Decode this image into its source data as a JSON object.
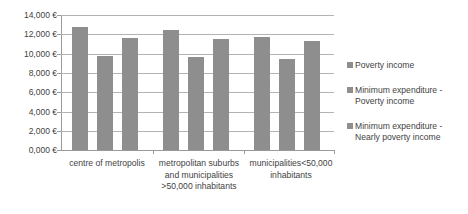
{
  "chart_data": {
    "type": "bar",
    "title": "",
    "xlabel": "",
    "ylabel": "",
    "grid": true,
    "legend_position": "right",
    "ylim": [
      0,
      14000
    ],
    "categories": [
      "centre of metropolis",
      "metropolitan suburbs and municipalities >50,000 inhabitants",
      "municipalities<50,000 inhabitants"
    ],
    "ytick_labels": [
      "14,000 €",
      "12,000 €",
      "10,000 €",
      "8,000 €",
      "6,000 €",
      "4,000 €",
      "2,000 €",
      "0,000 €"
    ],
    "ytick_values": [
      14000,
      12000,
      10000,
      8000,
      6000,
      4000,
      2000,
      0
    ],
    "series": [
      {
        "name": "Poverty income",
        "color": "#8e8e8e",
        "values": [
          12800,
          12450,
          11750
        ]
      },
      {
        "name": "Minimum expenditure - Poverty income",
        "color": "#8e8e8e",
        "values": [
          9700,
          9600,
          9400
        ]
      },
      {
        "name": "Minimum expenditure - Nearly poverty income",
        "color": "#8e8e8e",
        "values": [
          11600,
          11500,
          11300
        ]
      }
    ]
  },
  "axis": {
    "tick_0": "14,000 €",
    "tick_1": "12,000 €",
    "tick_2": "10,000 €",
    "tick_3": "8,000 €",
    "tick_4": "6,000 €",
    "tick_5": "4,000 €",
    "tick_6": "2,000 €",
    "tick_7": "0,000 €"
  },
  "categories": {
    "cat_0_line_0": "centre of metropolis",
    "cat_1_line_0": "metropolitan suburbs",
    "cat_1_line_1": "and municipalities",
    "cat_1_line_2": ">50,000 inhabitants",
    "cat_2_line_0": "municipalities<50,000",
    "cat_2_line_1": "inhabitants"
  },
  "legend": {
    "item_0": "Poverty income",
    "item_1_line_0": "Minimum expenditure -",
    "item_1_line_1": "Poverty income",
    "item_2_line_0": "Minimum expenditure -",
    "item_2_line_1": "Nearly poverty income"
  },
  "colors": {
    "bar": "#8e8e8e",
    "gridline": "#b3b3b3",
    "axis": "#9a9a9a",
    "text": "#3f3f3f",
    "background": "#ffffff"
  }
}
